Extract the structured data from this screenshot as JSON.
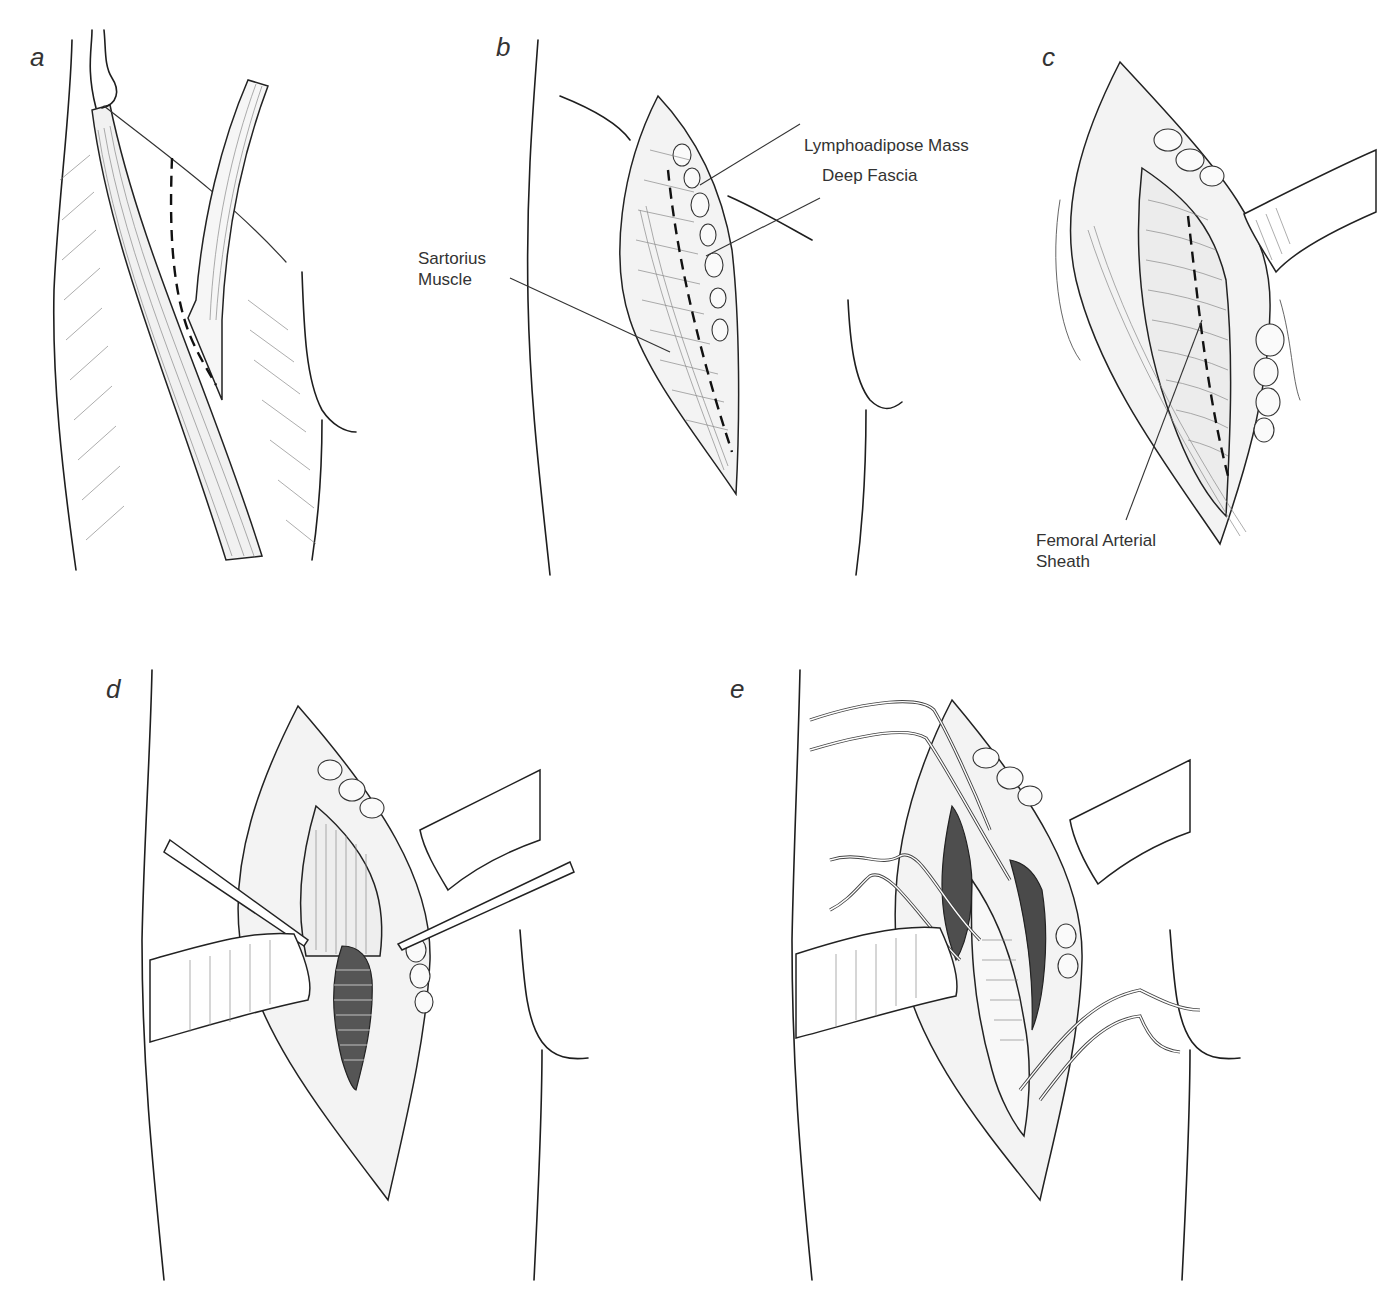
{
  "figure": {
    "type": "surgical illustration",
    "panels": [
      {
        "id": "a",
        "letter": "a",
        "description": "Thigh outline with sartorius muscle and femoral vessel course; dashed line marks skin incision along the vessel",
        "labels": []
      },
      {
        "id": "b",
        "letter": "b",
        "description": "Elliptical skin incision exposing lymphoadipose tissue and deep fascia; dashed line marks fascial incision",
        "labels": [
          {
            "text": "Lymphoadipose Mass",
            "lines": [
              "Lymphoadipose Mass"
            ]
          },
          {
            "text": "Deep Fascia",
            "lines": [
              "Deep Fascia"
            ]
          },
          {
            "text": "Sartorius Muscle",
            "lines": [
              "Sartorius",
              "Muscle"
            ]
          }
        ]
      },
      {
        "id": "c",
        "letter": "c",
        "description": "Wound retracted; femoral arterial sheath exposed with dashed incision line",
        "labels": [
          {
            "text": "Femoral Arterial Sheath",
            "lines": [
              "Femoral Arterial",
              "Sheath"
            ]
          }
        ]
      },
      {
        "id": "d",
        "letter": "d",
        "description": "Sheath opened with forceps, revealing the femoral artery; two retractors in place",
        "labels": []
      },
      {
        "id": "e",
        "letter": "e",
        "description": "Femoral artery and branches isolated with vessel loops (slings)",
        "labels": []
      }
    ]
  },
  "colors": {
    "ink": "#1e1e1e",
    "hatch": "#8a8a8a",
    "background": "#ffffff"
  }
}
